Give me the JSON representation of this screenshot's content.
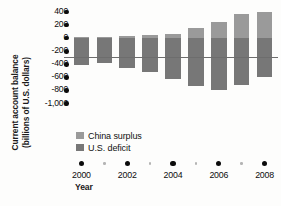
{
  "chart_data": {
    "type": "bar",
    "title": "",
    "subtitle": "",
    "xlabel": "Year",
    "ylabel": "Current account balance\n(billions of U.S. dollars)",
    "categories": [
      "2000",
      "2001",
      "2002",
      "2003",
      "2004",
      "2005",
      "2006",
      "2007",
      "2008"
    ],
    "series": [
      {
        "name": "China surplus",
        "color": "#9a9a9a",
        "values": [
          20,
          17,
          35,
          46,
          69,
          161,
          250,
          372,
          400
        ]
      },
      {
        "name": "U.S. deficit",
        "color": "#777777",
        "values": [
          -410,
          -385,
          -450,
          -520,
          -630,
          -730,
          -800,
          -710,
          -600
        ]
      }
    ],
    "ylim": [
      -1000,
      400
    ],
    "yticks": [
      400,
      200,
      0,
      -200,
      -400,
      -600,
      -800,
      -1000
    ],
    "ytick_labels": [
      "400",
      "200",
      "0",
      "-200",
      "-400",
      "-600",
      "-800",
      "-1,000"
    ],
    "xticks_major": [
      "2000",
      "2002",
      "2004",
      "2006",
      "2008"
    ],
    "xticks_minor": [
      "2001",
      "2003",
      "2005",
      "2007"
    ],
    "grid": false,
    "legend_position": "inside-lower-left",
    "zero_line_color": "#6d6d6d",
    "background_color": "#fdfdfc"
  }
}
